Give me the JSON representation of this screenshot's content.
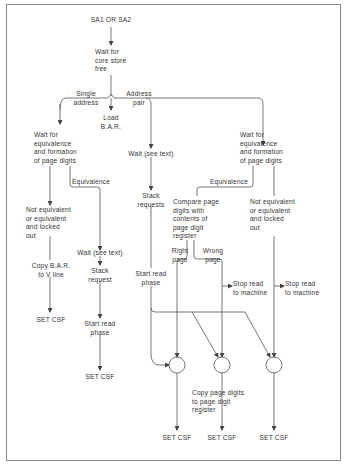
{
  "diagram": {
    "type": "flowchart",
    "start": "SA1 OR SA2",
    "nodes": {
      "wait_core": "Wait for\ncore store\nfree",
      "label_single": "Single\naddress",
      "label_pair": "Address\npair",
      "load_bar": "Load\nB.A.R.",
      "left_wait_equiv": "Wait for\nequivalence\nand formation\nof page digits",
      "left_equiv_label": "Equivalence",
      "left_not_equiv": "Not equivalent\nor equivalent\nand locked\nout",
      "copy_bar": "Copy B.A.R.\nto V line",
      "left_set_csf": "SET CSF",
      "mid_wait": "Wait (see text)",
      "mid_stack_request": "Stack\nrequest",
      "mid_start_read": "Start read\nphase",
      "mid_set_csf": "SET CSF",
      "pair_wait": "Wait (see text)",
      "pair_stack_requests": "Stack\nrequests",
      "pair_start_read": "Start read\nphase",
      "right_wait_equiv": "Wait for\nequivalence\nand formation\nof page digits",
      "right_equiv_label": "Equivalence",
      "compare": "Compare page\ndigits with\ncontents of\npage digit\nregister",
      "right_page": "Right\npage",
      "wrong_page": "Wrong\npage",
      "stop_read_1": "Stop read\nto machine",
      "right_not_equiv": "Not equivalent\nor equivalent\nand locked\nout",
      "stop_read_2": "Stop read\nto machine",
      "copy_page_digits": "Copy page digits\nto page digit\nregister",
      "bottom_set_csf_1": "SET CSF",
      "bottom_set_csf_2": "SET CSF",
      "bottom_set_csf_3": "SET CSF"
    },
    "colors": {
      "line": "#555555",
      "text": "#333333",
      "frame": "#8a8a8a"
    }
  }
}
